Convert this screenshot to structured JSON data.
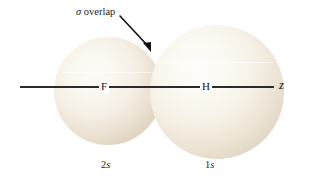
{
  "figure": {
    "background_color": "#ffffff",
    "line_color": "#2b2b2b",
    "orbital_fill_light": "#fdfbf6",
    "orbital_fill_shadow": "#cdbda5"
  },
  "annotation": {
    "sigma_symbol": "σ",
    "overlap_text": " overlap",
    "arrow_name": "overlap-pointer-arrow"
  },
  "axis": {
    "label": "z",
    "name": "internuclear-z-axis"
  },
  "atoms": [
    {
      "symbol": "F",
      "orbital_number": "2",
      "orbital_letter": "s"
    },
    {
      "symbol": "H",
      "orbital_number": "1",
      "orbital_letter": "s"
    }
  ],
  "atom_labels": {
    "fluorine": "F",
    "hydrogen": "H"
  },
  "captions": {
    "left_number": "2",
    "left_letter": "s",
    "right_number": "1",
    "right_letter": "s"
  }
}
